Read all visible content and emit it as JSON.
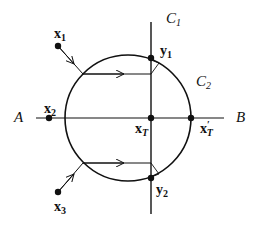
{
  "diagram": {
    "labels": {
      "C1": {
        "main": "C",
        "sub": "1"
      },
      "C2": {
        "main": "C",
        "sub": "2"
      },
      "A": "A",
      "B": "B",
      "x1": {
        "main": "x",
        "sub": "1"
      },
      "x2": {
        "main": "x",
        "sub": "2"
      },
      "x3": {
        "main": "x",
        "sub": "3"
      },
      "y1": {
        "main": "y",
        "sub": "1"
      },
      "y2": {
        "main": "y",
        "sub": "2"
      },
      "xT": {
        "main": "x",
        "sub": "T"
      },
      "xTprime": {
        "main": "x",
        "prime": "′",
        "sub": "T"
      }
    },
    "colors": {
      "stroke": "#111111",
      "background": "#ffffff"
    }
  }
}
